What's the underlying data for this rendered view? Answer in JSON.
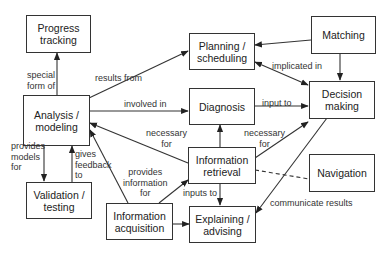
{
  "nodes": {
    "progress_tracking": {
      "label": "Progress\ntracking"
    },
    "analysis_modeling": {
      "label": "Analysis /\nmodeling"
    },
    "validation_testing": {
      "label": "Validation /\ntesting"
    },
    "planning_scheduling": {
      "label": "Planning /\nscheduling"
    },
    "diagnosis": {
      "label": "Diagnosis"
    },
    "matching": {
      "label": "Matching"
    },
    "decision_making": {
      "label": "Decision\nmaking"
    },
    "information_retrieval": {
      "label": "Information\nretrieval"
    },
    "navigation": {
      "label": "Navigation"
    },
    "information_acquisition": {
      "label": "Information\nacquisition"
    },
    "explaining_advising": {
      "label": "Explaining /\nadvising"
    }
  },
  "edges": {
    "special_form_of": "special\nform of",
    "results_from": "results from",
    "involved_in": "involved in",
    "provides_models_for": "provides\nmodels\nfor",
    "gives_feedback_to": "gives\nfeedback\nto",
    "necessary_for_analysis": "necessary\nfor",
    "provides_information_for": "provides\ninformation\nfor",
    "implicated_in": "implicated in",
    "input_to": "input to",
    "necessary_for_decision": "necessary\nfor",
    "inputs_to": "inputs to",
    "communicate_results": "communicate results"
  }
}
